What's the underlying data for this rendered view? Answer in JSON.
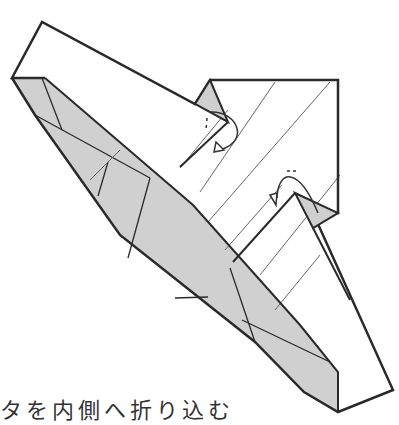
{
  "diagram": {
    "type": "origami-fold-step",
    "colors": {
      "outline": "#2a2a2a",
      "paper": "#ffffff",
      "shaded": "#cfcfcf",
      "crease": "#555555"
    },
    "annotations": [
      {
        "name": "fold-inside-arrow-upper",
        "symbol": "curved arrow with dashed valley"
      },
      {
        "name": "fold-inside-arrow-lower",
        "symbol": "curved arrow with dashed valley"
      }
    ]
  },
  "caption": {
    "text": "タを内側へ折り込む"
  }
}
